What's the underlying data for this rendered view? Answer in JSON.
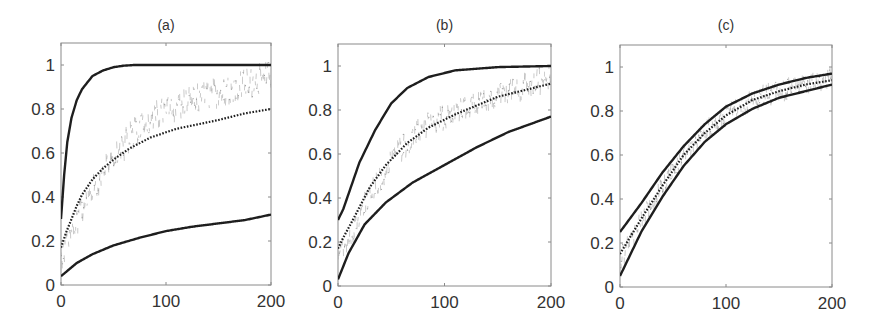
{
  "figure": {
    "panels": [
      {
        "id": "a",
        "title": "(a)"
      },
      {
        "id": "b",
        "title": "(b)"
      },
      {
        "id": "c",
        "title": "(c)"
      }
    ]
  },
  "chart_data": [
    {
      "type": "line",
      "title": "(a)",
      "xlabel": "",
      "ylabel": "",
      "xlim": [
        0,
        200
      ],
      "ylim": [
        0,
        1.1
      ],
      "xticks": [
        0,
        100,
        200
      ],
      "yticks": [
        0,
        0.2,
        0.4,
        0.6,
        0.8,
        1
      ],
      "ytick_labels": [
        "0",
        "0.2",
        "0.4",
        "0.6",
        "0.8",
        "1"
      ],
      "xtick_labels": [
        "0",
        "100",
        "200"
      ],
      "grid": false,
      "legend": null,
      "series": [
        {
          "name": "upper bound",
          "style": "solid",
          "x": [
            0,
            3,
            6,
            10,
            15,
            20,
            25,
            30,
            40,
            50,
            60,
            70,
            100,
            150,
            200
          ],
          "y": [
            0.3,
            0.5,
            0.65,
            0.76,
            0.84,
            0.89,
            0.92,
            0.95,
            0.975,
            0.99,
            0.997,
            1.0,
            1.0,
            1.0,
            1.0
          ]
        },
        {
          "name": "mean",
          "style": "dotted",
          "x": [
            0,
            5,
            10,
            15,
            20,
            30,
            40,
            50,
            65,
            85,
            110,
            130,
            150,
            175,
            200
          ],
          "y": [
            0.17,
            0.24,
            0.3,
            0.36,
            0.41,
            0.48,
            0.53,
            0.57,
            0.62,
            0.67,
            0.71,
            0.73,
            0.75,
            0.78,
            0.8
          ]
        },
        {
          "name": "lower bound",
          "style": "solid",
          "x": [
            0,
            5,
            15,
            30,
            50,
            75,
            100,
            125,
            150,
            175,
            200
          ],
          "y": [
            0.04,
            0.06,
            0.1,
            0.14,
            0.18,
            0.215,
            0.245,
            0.265,
            0.28,
            0.295,
            0.32
          ]
        },
        {
          "name": "observed",
          "style": "scatter",
          "trend_x": [
            0,
            20,
            50,
            80,
            120,
            160,
            200
          ],
          "trend_y": [
            0.12,
            0.35,
            0.58,
            0.75,
            0.83,
            0.89,
            0.95
          ],
          "noise": 0.06
        }
      ]
    },
    {
      "type": "line",
      "title": "(b)",
      "xlabel": "",
      "ylabel": "",
      "xlim": [
        0,
        200
      ],
      "ylim": [
        0,
        1.1
      ],
      "xticks": [
        0,
        100,
        200
      ],
      "yticks": [
        0,
        0.2,
        0.4,
        0.6,
        0.8,
        1
      ],
      "ytick_labels": [
        "0",
        "0.2",
        "0.4",
        "0.6",
        "0.8",
        "1"
      ],
      "xtick_labels": [
        "0",
        "100",
        "200"
      ],
      "grid": false,
      "legend": null,
      "series": [
        {
          "name": "upper bound",
          "style": "solid",
          "x": [
            0,
            5,
            10,
            20,
            35,
            50,
            65,
            85,
            110,
            150,
            200
          ],
          "y": [
            0.3,
            0.35,
            0.42,
            0.56,
            0.71,
            0.83,
            0.9,
            0.95,
            0.98,
            0.995,
            1.0
          ]
        },
        {
          "name": "mean",
          "style": "dotted",
          "x": [
            0,
            5,
            15,
            30,
            45,
            65,
            85,
            110,
            130,
            150,
            175,
            200
          ],
          "y": [
            0.17,
            0.22,
            0.31,
            0.45,
            0.55,
            0.65,
            0.72,
            0.78,
            0.82,
            0.86,
            0.89,
            0.92
          ]
        },
        {
          "name": "lower bound",
          "style": "solid",
          "x": [
            0,
            5,
            10,
            25,
            45,
            70,
            100,
            130,
            160,
            200
          ],
          "y": [
            0.03,
            0.09,
            0.15,
            0.28,
            0.38,
            0.47,
            0.55,
            0.63,
            0.7,
            0.77
          ]
        },
        {
          "name": "observed",
          "style": "scatter",
          "trend_x": [
            0,
            20,
            50,
            80,
            120,
            160,
            200
          ],
          "trend_y": [
            0.12,
            0.32,
            0.58,
            0.72,
            0.81,
            0.88,
            0.95
          ],
          "noise": 0.05
        }
      ]
    },
    {
      "type": "line",
      "title": "(c)",
      "xlabel": "",
      "ylabel": "",
      "xlim": [
        0,
        200
      ],
      "ylim": [
        0,
        1.1
      ],
      "xticks": [
        0,
        100,
        200
      ],
      "yticks": [
        0,
        0.2,
        0.4,
        0.6,
        0.8,
        1
      ],
      "ytick_labels": [
        "0",
        "0.2",
        "0.4",
        "0.6",
        "0.8",
        "1"
      ],
      "xtick_labels": [
        "0",
        "100",
        "200"
      ],
      "grid": false,
      "legend": null,
      "series": [
        {
          "name": "upper bound",
          "style": "solid",
          "x": [
            0,
            20,
            40,
            60,
            80,
            100,
            125,
            150,
            175,
            200
          ],
          "y": [
            0.25,
            0.38,
            0.52,
            0.64,
            0.74,
            0.82,
            0.88,
            0.92,
            0.95,
            0.97
          ]
        },
        {
          "name": "mean",
          "style": "dotted",
          "x": [
            0,
            20,
            40,
            60,
            80,
            100,
            125,
            150,
            175,
            200
          ],
          "y": [
            0.15,
            0.31,
            0.46,
            0.6,
            0.7,
            0.78,
            0.85,
            0.89,
            0.92,
            0.94
          ]
        },
        {
          "name": "lower bound",
          "style": "solid",
          "x": [
            0,
            20,
            40,
            60,
            80,
            100,
            125,
            150,
            175,
            200
          ],
          "y": [
            0.05,
            0.25,
            0.41,
            0.55,
            0.66,
            0.74,
            0.81,
            0.86,
            0.89,
            0.92
          ]
        },
        {
          "name": "observed",
          "style": "scatter",
          "trend_x": [
            0,
            20,
            40,
            60,
            80,
            100,
            125,
            150,
            175,
            200
          ],
          "trend_y": [
            0.12,
            0.31,
            0.46,
            0.6,
            0.7,
            0.78,
            0.85,
            0.89,
            0.92,
            0.95
          ],
          "noise": 0.04
        }
      ]
    }
  ],
  "layout": {
    "panels": [
      {
        "left": 61,
        "right": 271,
        "top": 43,
        "bottom": 285
      },
      {
        "left": 338,
        "right": 551,
        "top": 44,
        "bottom": 286
      },
      {
        "left": 620,
        "right": 832,
        "top": 45,
        "bottom": 287
      }
    ],
    "colors": {
      "line": "#1e1e1e",
      "scatter": "#9a9a9a",
      "frame": "#8a8a8a",
      "text": "#333333"
    }
  }
}
